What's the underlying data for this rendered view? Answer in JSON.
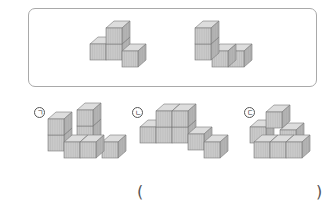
{
  "problem": {
    "reference_shapes": [
      {
        "id": "ref-1",
        "description": "4 cubes: 3 in a row on bottom, 1 on top of the middle-left"
      },
      {
        "id": "ref-2",
        "description": "4 cubes: 3 in a row on bottom, 1 on top of the leftmost"
      }
    ],
    "options": [
      {
        "label": "ㄱ",
        "id": "option-a"
      },
      {
        "label": "ㄴ",
        "id": "option-b"
      },
      {
        "label": "ㄷ",
        "id": "option-c"
      }
    ],
    "answer_blank": {
      "open": "(",
      "close": ")",
      "value": ""
    }
  },
  "colors": {
    "frame_border": "#a9a9a9",
    "cube_front": "#c9c9c9",
    "cube_top": "#dddddd",
    "cube_side": "#b2b2b2",
    "cube_edge": "#787878"
  }
}
